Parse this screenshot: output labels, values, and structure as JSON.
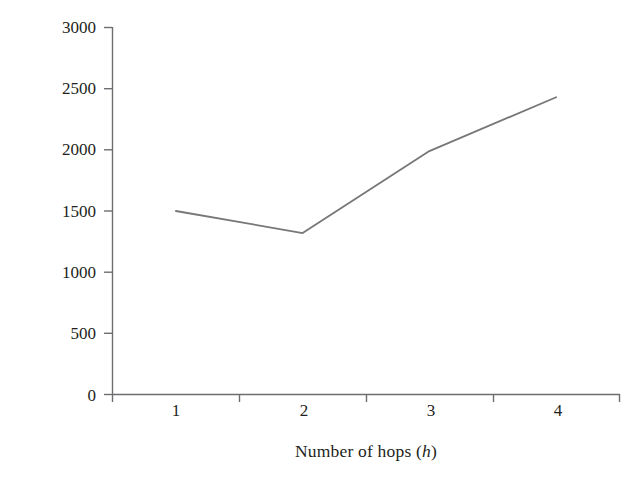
{
  "chart_data": {
    "type": "line",
    "title": "",
    "xlabel": "Number of hops (h)",
    "xlabel_plain": "Number of hops",
    "xlabel_variable": "h",
    "ylabel": "Total messages (Ms)",
    "categories": [
      "1",
      "2",
      "3",
      "4"
    ],
    "x": [
      1,
      2,
      3,
      4
    ],
    "values": [
      1500,
      1320,
      1990,
      2430
    ],
    "series": [
      {
        "name": "Total messages",
        "values": [
          1500,
          1320,
          1990,
          2430
        ]
      }
    ],
    "ylim": [
      0,
      3000
    ],
    "yticks": [
      "0",
      "500",
      "1000",
      "1500",
      "2000",
      "2500",
      "3000"
    ],
    "ytick_values": [
      0,
      500,
      1000,
      1500,
      2000,
      2500,
      3000
    ],
    "xticks": [
      "1",
      "2",
      "3",
      "4"
    ],
    "grid": false,
    "legend": false,
    "legend_position": "none",
    "line_color": "#77777a",
    "axis_color": "#6d6e71",
    "text_color": "#231f20",
    "background_color": "#ffffff"
  }
}
